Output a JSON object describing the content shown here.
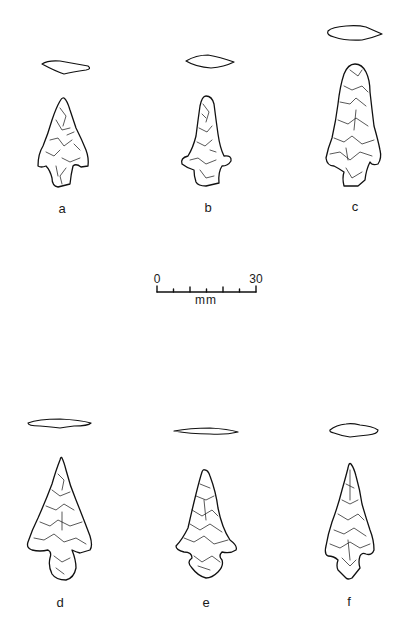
{
  "figure": {
    "type": "archaeological projectile point illustration",
    "specimens": [
      {
        "id": "a",
        "label": "a",
        "row": 1,
        "column": 1
      },
      {
        "id": "b",
        "label": "b",
        "row": 1,
        "column": 2
      },
      {
        "id": "c",
        "label": "c",
        "row": 1,
        "column": 3
      },
      {
        "id": "d",
        "label": "d",
        "row": 2,
        "column": 1
      },
      {
        "id": "e",
        "label": "e",
        "row": 2,
        "column": 2
      },
      {
        "id": "f",
        "label": "f",
        "row": 2,
        "column": 3
      }
    ],
    "scale_bar": {
      "min_label": "0",
      "max_label": "30",
      "unit": "mm",
      "tick_count": 7
    },
    "colors": {
      "background": "#ffffff",
      "ink": "#111111"
    }
  }
}
